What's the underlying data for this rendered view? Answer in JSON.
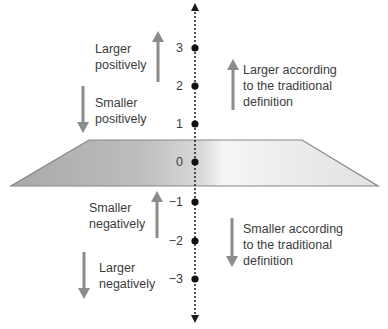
{
  "diagram": {
    "axis": {
      "ticks": [
        {
          "value": 3,
          "label": "3",
          "y": 48
        },
        {
          "value": 2,
          "label": "2",
          "y": 86
        },
        {
          "value": 1,
          "label": "1",
          "y": 124
        },
        {
          "value": 0,
          "label": "0",
          "y": 162
        },
        {
          "value": -1,
          "label": "−1",
          "y": 202
        },
        {
          "value": -2,
          "label": "−2",
          "y": 241
        },
        {
          "value": -3,
          "label": "−3",
          "y": 279
        }
      ],
      "style": "dotted vertical number line with arrowheads at both ends"
    },
    "plane": {
      "description": "gray trapezoidal plane through zero",
      "colors": {
        "left": "#adadad",
        "center": "#f4f4f4",
        "right": "#e4e4e4",
        "edge": "#858585"
      }
    },
    "labels": {
      "larger_positively": {
        "line1": "Larger",
        "line2": "positively",
        "arrow": "up"
      },
      "smaller_positively": {
        "line1": "Smaller",
        "line2": "positively",
        "arrow": "down"
      },
      "smaller_negatively": {
        "line1": "Smaller",
        "line2": "negatively",
        "arrow": "up"
      },
      "larger_negatively": {
        "line1": "Larger",
        "line2": "negatively",
        "arrow": "down"
      },
      "larger_traditional": {
        "line1": "Larger according",
        "line2": "to the traditional",
        "line3": "definition",
        "arrow": "up"
      },
      "smaller_traditional": {
        "line1": "Smaller according",
        "line2": "to the traditional",
        "line3": "definition",
        "arrow": "down"
      }
    },
    "colors": {
      "arrow": "#8c8c8c",
      "axis": "#1a1a1a",
      "text": "#3c3c3c"
    }
  }
}
